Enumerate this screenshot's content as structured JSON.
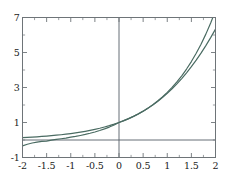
{
  "chart_data": {
    "type": "line",
    "title": "",
    "subtitle": "",
    "xlabel": "",
    "ylabel": "",
    "xlim": [
      -2,
      2
    ],
    "ylim": [
      -1,
      7
    ],
    "grid": false,
    "legend": null,
    "legend_position": "none",
    "annotations": [],
    "axis_lines": {
      "vertical_at_x": 0,
      "horizontal_at_y": 0,
      "color": "#555f66"
    },
    "frame": {
      "visible": true,
      "color": "#6e7478",
      "ticks_inward": true
    },
    "xticks": [
      -2,
      -1.5,
      -1,
      -0.5,
      0,
      0.5,
      1,
      1.5,
      2
    ],
    "xtick_labels": [
      "-2",
      "-1.5",
      "-1",
      "-0.5",
      "0",
      "0.5",
      "1",
      "1.5",
      "2"
    ],
    "xminor_ticks": [
      -1.75,
      -1.25,
      -0.75,
      -0.25,
      0.25,
      0.75,
      1.25,
      1.75
    ],
    "yticks": [
      -1,
      1,
      3,
      5,
      7
    ],
    "ytick_labels": [
      "-1",
      "1",
      "3",
      "5",
      "7"
    ],
    "yminor_ticks": [
      0,
      2,
      4,
      6
    ],
    "series": [
      {
        "name": "exp(x)",
        "color": "#4a6b62",
        "width": 1.2,
        "x": [
          -2,
          -1.9,
          -1.8,
          -1.7,
          -1.6,
          -1.5,
          -1.4,
          -1.3,
          -1.2,
          -1.1,
          -1,
          -0.9,
          -0.8,
          -0.7,
          -0.6,
          -0.5,
          -0.4,
          -0.3,
          -0.2,
          -0.1,
          0,
          0.1,
          0.2,
          0.3,
          0.4,
          0.5,
          0.6,
          0.7,
          0.8,
          0.9,
          1,
          1.1,
          1.2,
          1.3,
          1.4,
          1.5,
          1.6,
          1.7,
          1.8,
          1.9,
          2
        ],
        "values": [
          0.135,
          0.15,
          0.165,
          0.183,
          0.202,
          0.223,
          0.247,
          0.273,
          0.301,
          0.333,
          0.368,
          0.407,
          0.449,
          0.497,
          0.549,
          0.607,
          0.67,
          0.741,
          0.819,
          0.905,
          1,
          1.105,
          1.221,
          1.35,
          1.492,
          1.649,
          1.822,
          2.014,
          2.226,
          2.46,
          2.718,
          3.004,
          3.32,
          3.669,
          4.055,
          4.482,
          4.953,
          5.474,
          6.05,
          6.686,
          7.389
        ]
      },
      {
        "name": "1 + x + x^2/2 + x^3/6",
        "color": "#4a6b62",
        "width": 1.2,
        "x": [
          -2,
          -1.9,
          -1.8,
          -1.7,
          -1.6,
          -1.5,
          -1.4,
          -1.3,
          -1.2,
          -1.1,
          -1,
          -0.9,
          -0.8,
          -0.7,
          -0.6,
          -0.5,
          -0.4,
          -0.3,
          -0.2,
          -0.1,
          0,
          0.1,
          0.2,
          0.3,
          0.4,
          0.5,
          0.6,
          0.7,
          0.8,
          0.9,
          1,
          1.1,
          1.2,
          1.3,
          1.4,
          1.5,
          1.6,
          1.7,
          1.8,
          1.9,
          2
        ],
        "values": [
          -0.333,
          -0.243,
          -0.172,
          -0.117,
          -0.075,
          -0.0625,
          -0.005,
          0.036,
          0.072,
          0.105,
          0.1667,
          0.2035,
          0.2587,
          0.3178,
          0.384,
          0.4583,
          0.5413,
          0.6355,
          0.7387,
          0.8548,
          1,
          1.1052,
          1.2213,
          1.3495,
          1.4907,
          1.6458,
          1.816,
          2.0022,
          2.2053,
          2.4265,
          2.6667,
          2.9268,
          3.208,
          3.511,
          3.837,
          4.1875,
          4.5627,
          4.9638,
          5.392,
          5.848,
          6.333
        ]
      }
    ]
  },
  "ticks": {
    "y": [
      {
        "label": "7",
        "value": 7
      },
      {
        "label": "5",
        "value": 5
      },
      {
        "label": "3",
        "value": 3
      },
      {
        "label": "1",
        "value": 1
      },
      {
        "label": "-1",
        "value": -1
      }
    ],
    "x": [
      {
        "label": "-2",
        "value": -2
      },
      {
        "label": "-1.5",
        "value": -1.5
      },
      {
        "label": "-1",
        "value": -1
      },
      {
        "label": "-0.5",
        "value": -0.5
      },
      {
        "label": "0",
        "value": 0
      },
      {
        "label": "0.5",
        "value": 0.5
      },
      {
        "label": "1",
        "value": 1
      },
      {
        "label": "1.5",
        "value": 1.5
      },
      {
        "label": "2",
        "value": 2
      }
    ]
  }
}
